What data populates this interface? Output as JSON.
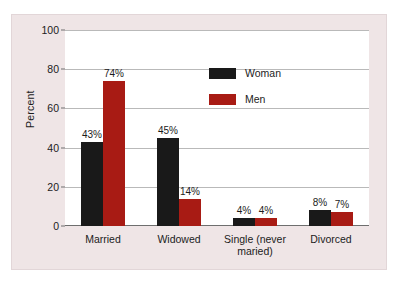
{
  "chart_data": {
    "type": "bar",
    "title": "",
    "subtitle": "",
    "xlabel": "",
    "ylabel": "Percent",
    "ylim": [
      0,
      100
    ],
    "yticks": [
      0,
      20,
      40,
      60,
      80,
      100
    ],
    "ytick_labels": [
      "0",
      "20",
      "40",
      "60",
      "80",
      "100"
    ],
    "grid": true,
    "legend_position": "inside-upper-right",
    "categories": [
      "Married",
      "Widowed",
      "Single (never maried)",
      "Divorced"
    ],
    "category_lines": [
      [
        "Married"
      ],
      [
        "Widowed"
      ],
      [
        "Single (never",
        "maried)"
      ],
      [
        "Divorced"
      ]
    ],
    "series": [
      {
        "name": "Woman",
        "color": "#191919",
        "values": [
          43,
          45,
          4,
          8
        ],
        "data_labels": [
          "43%",
          "45%",
          "4%",
          "8%"
        ]
      },
      {
        "name": "Men",
        "color": "#a81b14",
        "values": [
          74,
          14,
          4,
          7
        ],
        "data_labels": [
          "74%",
          "14%",
          "4%",
          "7%"
        ]
      }
    ]
  },
  "legend": {
    "entries": [
      {
        "label": "Woman",
        "swatch": "woman-swatch"
      },
      {
        "label": "Men",
        "swatch": "men-swatch"
      }
    ]
  },
  "colors": {
    "panel_background": "#efe5e6",
    "plot_background": "#ffffff",
    "gridline": "#b9b9b9",
    "axis": "#6e6e6e",
    "text": "#1c1c1c",
    "series_woman": "#191919",
    "series_men": "#a81b14"
  }
}
